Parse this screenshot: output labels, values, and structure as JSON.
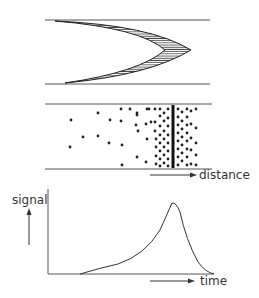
{
  "panels": {
    "top": {
      "description": "chevron-shaped hatched band between two parallel walls"
    },
    "middle": {
      "description": "particle distribution between walls, densest at a front",
      "axis_label": "distance"
    },
    "bottom": {
      "description": "signal vs time curve",
      "y_label": "signal",
      "x_label": "time"
    }
  },
  "colors": {
    "ink": "#333333",
    "wall": "#555555",
    "background": "#ffffff"
  },
  "dots": [
    [
      71,
      120
    ],
    [
      70,
      147
    ],
    [
      98,
      113
    ],
    [
      83,
      137
    ],
    [
      98,
      136
    ],
    [
      110,
      120
    ],
    [
      109,
      143
    ],
    [
      121,
      109
    ],
    [
      122,
      145
    ],
    [
      121,
      121
    ],
    [
      130,
      109
    ],
    [
      122,
      165
    ],
    [
      138,
      131
    ],
    [
      137,
      113
    ],
    [
      137,
      115
    ],
    [
      137,
      157
    ],
    [
      136,
      125
    ],
    [
      147,
      109
    ],
    [
      147,
      139
    ],
    [
      151,
      122
    ],
    [
      146,
      124
    ],
    [
      146,
      162
    ],
    [
      149,
      109
    ],
    [
      155,
      109
    ],
    [
      155,
      122
    ],
    [
      155,
      131
    ],
    [
      156,
      139
    ],
    [
      156,
      147
    ],
    [
      156,
      156
    ],
    [
      156,
      164
    ],
    [
      160,
      109
    ],
    [
      160,
      116
    ],
    [
      160,
      126
    ],
    [
      160,
      135
    ],
    [
      160,
      143
    ],
    [
      160,
      151
    ],
    [
      160,
      159
    ],
    [
      160,
      166
    ],
    [
      164,
      113
    ],
    [
      164,
      121
    ],
    [
      164,
      131
    ],
    [
      164,
      139
    ],
    [
      164,
      147
    ],
    [
      164,
      155
    ],
    [
      164,
      163
    ],
    [
      168,
      109
    ],
    [
      168,
      118
    ],
    [
      168,
      126
    ],
    [
      168,
      135
    ],
    [
      168,
      143
    ],
    [
      168,
      151
    ],
    [
      168,
      159
    ],
    [
      168,
      166
    ],
    [
      178,
      109
    ],
    [
      178,
      117
    ],
    [
      178,
      125
    ],
    [
      178,
      133
    ],
    [
      178,
      141
    ],
    [
      178,
      149
    ],
    [
      178,
      157
    ],
    [
      178,
      165
    ],
    [
      182,
      112
    ],
    [
      182,
      121
    ],
    [
      182,
      129
    ],
    [
      182,
      137
    ],
    [
      182,
      145
    ],
    [
      182,
      153
    ],
    [
      182,
      161
    ],
    [
      187,
      109
    ],
    [
      187,
      117
    ],
    [
      187,
      125
    ],
    [
      187,
      133
    ],
    [
      187,
      141
    ],
    [
      187,
      149
    ],
    [
      187,
      157
    ],
    [
      187,
      165
    ],
    [
      191,
      111
    ],
    [
      191,
      124
    ],
    [
      191,
      138
    ],
    [
      191,
      150
    ],
    [
      191,
      164
    ],
    [
      196,
      109
    ],
    [
      196,
      128
    ],
    [
      196,
      143
    ],
    [
      196,
      155
    ],
    [
      196,
      165
    ]
  ]
}
